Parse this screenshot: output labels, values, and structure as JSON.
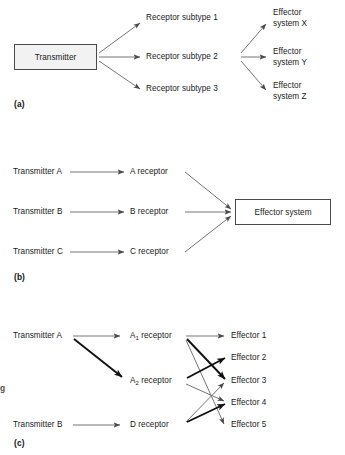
{
  "figure": {
    "background": "#ffffff",
    "ink": "#1a1a1a",
    "box_fill": "#f2f2f2",
    "box_border": "#4a4a4a",
    "line_thin": "#6e6e6e",
    "line_thick": "#111111"
  },
  "margin_fragment": {
    "text": "g"
  },
  "panels": [
    {
      "id": "a",
      "label": "(a)",
      "source": {
        "text": "Transmitter"
      },
      "receptors": [
        {
          "text": "Receptor subtype 1"
        },
        {
          "text": "Receptor subtype 2"
        },
        {
          "text": "Receptor subtype 3"
        }
      ],
      "effectors": [
        {
          "line1": "Effector",
          "line2": "system X"
        },
        {
          "line1": "Effector",
          "line2": "system Y"
        },
        {
          "line1": "Effector",
          "line2": "system Z"
        }
      ]
    },
    {
      "id": "b",
      "label": "(b)",
      "transmitters": [
        {
          "text": "Transmitter A"
        },
        {
          "text": "Transmitter B"
        },
        {
          "text": "Transmitter C"
        }
      ],
      "receptors": [
        {
          "text": "A receptor"
        },
        {
          "text": "B receptor"
        },
        {
          "text": "C receptor"
        }
      ],
      "effector": {
        "text": "Effector system"
      }
    },
    {
      "id": "c",
      "label": "(c)",
      "transmitters": [
        {
          "text": "Transmitter A"
        },
        {
          "text": "Transmitter B"
        }
      ],
      "receptors": [
        {
          "base": "A",
          "subscript": "1",
          "suffix": " receptor"
        },
        {
          "base": "A",
          "subscript": "2",
          "suffix": " receptor"
        },
        {
          "base": "D",
          "subscript": "",
          "suffix": " receptor"
        }
      ],
      "effectors": [
        {
          "text": "Effector 1"
        },
        {
          "text": "Effector 2"
        },
        {
          "text": "Effector 3"
        },
        {
          "text": "Effector 4"
        },
        {
          "text": "Effector 5"
        }
      ]
    }
  ]
}
